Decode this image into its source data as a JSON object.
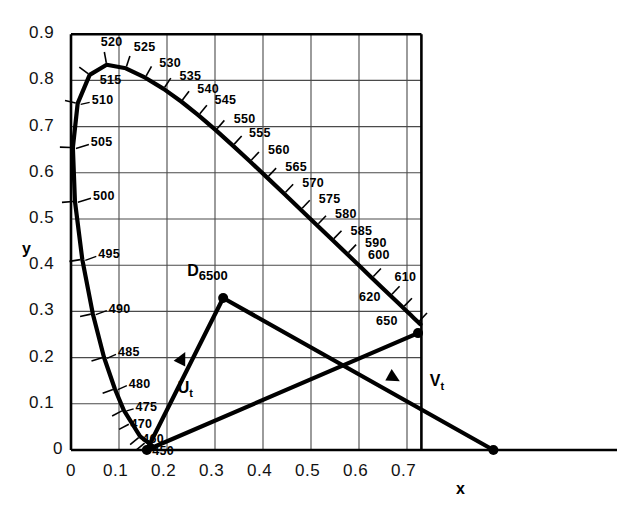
{
  "chart_data": {
    "type": "line",
    "title": "",
    "xlabel": "x",
    "ylabel": "y",
    "xlim": [
      0,
      0.73
    ],
    "ylim": [
      0,
      0.9
    ],
    "grid": true,
    "xticks": [
      "0",
      "0.1",
      "0.2",
      "0.3",
      "0.4",
      "0.5",
      "0.6",
      "0.7"
    ],
    "xtick_values": [
      0,
      0.1,
      0.2,
      0.3,
      0.4,
      0.5,
      0.6,
      0.7
    ],
    "yticks": [
      "0",
      "0.1",
      "0.2",
      "0.3",
      "0.4",
      "0.5",
      "0.6",
      "0.7",
      "0.8",
      "0.9"
    ],
    "ytick_values": [
      0,
      0.1,
      0.2,
      0.3,
      0.4,
      0.5,
      0.6,
      0.7,
      0.8,
      0.9
    ],
    "series": [
      {
        "name": "spectral-locus",
        "points": [
          [
            0.1741,
            0.005
          ],
          [
            0.144,
            0.0297
          ],
          [
            0.1096,
            0.0868
          ],
          [
            0.0913,
            0.1327
          ],
          [
            0.0687,
            0.2007
          ],
          [
            0.0454,
            0.295
          ],
          [
            0.0235,
            0.4127
          ],
          [
            0.0082,
            0.5384
          ],
          [
            0.0039,
            0.6548
          ],
          [
            0.0139,
            0.7502
          ],
          [
            0.0389,
            0.812
          ],
          [
            0.0743,
            0.8338
          ],
          [
            0.1142,
            0.8262
          ],
          [
            0.1547,
            0.8059
          ],
          [
            0.1929,
            0.7816
          ],
          [
            0.2296,
            0.7543
          ],
          [
            0.2658,
            0.7243
          ],
          [
            0.3016,
            0.6923
          ],
          [
            0.3373,
            0.6589
          ],
          [
            0.3731,
            0.6245
          ],
          [
            0.4087,
            0.5896
          ],
          [
            0.4441,
            0.5547
          ],
          [
            0.4788,
            0.5202
          ],
          [
            0.5125,
            0.4866
          ],
          [
            0.5448,
            0.4544
          ],
          [
            0.5752,
            0.4242
          ],
          [
            0.6029,
            0.3965
          ],
          [
            0.627,
            0.3725
          ],
          [
            0.6482,
            0.3514
          ],
          [
            0.6658,
            0.334
          ],
          [
            0.6801,
            0.3197
          ],
          [
            0.6915,
            0.3083
          ],
          [
            0.7006,
            0.2993
          ],
          [
            0.7079,
            0.292
          ],
          [
            0.714,
            0.2859
          ],
          [
            0.719,
            0.2809
          ],
          [
            0.723,
            0.277
          ],
          [
            0.726,
            0.274
          ],
          [
            0.728,
            0.272
          ]
        ]
      },
      {
        "name": "purple-line",
        "points": [
          [
            0.723,
            0.253
          ],
          [
            0.158,
            0.0
          ]
        ]
      }
    ],
    "wavelength_ticks": [
      {
        "label": "450",
        "x": 0.1566,
        "y": 0.0177
      },
      {
        "label": "460",
        "x": 0.1441,
        "y": 0.0297
      },
      {
        "label": "470",
        "x": 0.1241,
        "y": 0.0578
      },
      {
        "label": "475",
        "x": 0.1096,
        "y": 0.0868
      },
      {
        "label": "480",
        "x": 0.0913,
        "y": 0.1327
      },
      {
        "label": "485",
        "x": 0.0687,
        "y": 0.2007
      },
      {
        "label": "490",
        "x": 0.0454,
        "y": 0.295
      },
      {
        "label": "495",
        "x": 0.0235,
        "y": 0.4127
      },
      {
        "label": "500",
        "x": 0.0082,
        "y": 0.5384
      },
      {
        "label": "505",
        "x": 0.0039,
        "y": 0.6548
      },
      {
        "label": "510",
        "x": 0.0139,
        "y": 0.7502
      },
      {
        "label": "515",
        "x": 0.0389,
        "y": 0.812
      },
      {
        "label": "520",
        "x": 0.0743,
        "y": 0.8338
      },
      {
        "label": "525",
        "x": 0.1142,
        "y": 0.8262
      },
      {
        "label": "530",
        "x": 0.1547,
        "y": 0.8059
      },
      {
        "label": "535",
        "x": 0.1929,
        "y": 0.7816
      },
      {
        "label": "540",
        "x": 0.2296,
        "y": 0.7543
      },
      {
        "label": "545",
        "x": 0.2658,
        "y": 0.7243
      },
      {
        "label": "550",
        "x": 0.3016,
        "y": 0.6923
      },
      {
        "label": "555",
        "x": 0.3373,
        "y": 0.6589
      },
      {
        "label": "560",
        "x": 0.3731,
        "y": 0.6245
      },
      {
        "label": "565",
        "x": 0.4087,
        "y": 0.5896
      },
      {
        "label": "570",
        "x": 0.4441,
        "y": 0.5547
      },
      {
        "label": "575",
        "x": 0.4788,
        "y": 0.5202
      },
      {
        "label": "580",
        "x": 0.5125,
        "y": 0.4866
      },
      {
        "label": "585",
        "x": 0.5448,
        "y": 0.4544
      },
      {
        "label": "590",
        "x": 0.5752,
        "y": 0.4242
      },
      {
        "label": "600",
        "x": 0.627,
        "y": 0.3725
      },
      {
        "label": "610",
        "x": 0.6658,
        "y": 0.334
      },
      {
        "label": "620",
        "x": 0.6915,
        "y": 0.3083
      },
      {
        "label": "650",
        "x": 0.723,
        "y": 0.276
      }
    ],
    "annotations": [
      {
        "name": "illuminant-d6500",
        "label": "D",
        "sub": "6500",
        "x": 0.317,
        "y": 0.329
      },
      {
        "name": "vector-ut",
        "label": "U",
        "sub": "t",
        "x": 0.235,
        "y": 0.14
      },
      {
        "name": "vector-vt",
        "label": "V",
        "sub": "t",
        "x": 0.76,
        "y": 0.155
      }
    ],
    "vectors": [
      {
        "name": "ut-vector",
        "label": "Ut",
        "start": [
          0.158,
          0.0
        ],
        "end": [
          0.317,
          0.329
        ],
        "arrow_at": [
          0.238,
          0.212
        ],
        "endpoint_dot": true
      },
      {
        "name": "vt-vector",
        "label": "Vt",
        "start": [
          0.317,
          0.329
        ],
        "end": [
          0.88,
          0.0
        ],
        "arrow_at": [
          0.685,
          0.149
        ],
        "endpoint_dot": true
      },
      {
        "name": "purple-chord-vector",
        "label": "",
        "start": [
          0.158,
          0.0
        ],
        "end": [
          0.723,
          0.253
        ],
        "arrow_at": null,
        "endpoint_dot": true
      }
    ],
    "key_points": [
      {
        "name": "d6500-point",
        "x": 0.317,
        "y": 0.329
      },
      {
        "name": "blue-end-point",
        "x": 0.158,
        "y": 0.0
      },
      {
        "name": "red-end-point",
        "x": 0.723,
        "y": 0.253
      },
      {
        "name": "vt-terminus-point",
        "x": 0.88,
        "y": 0.0
      },
      {
        "name": "vector-crossing-point",
        "x": 0.598,
        "y": 0.192
      }
    ]
  },
  "axes": {
    "x_title": "x",
    "y_title": "y"
  }
}
